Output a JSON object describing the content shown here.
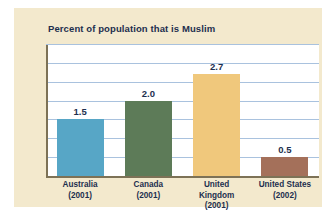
{
  "chart_data": {
    "type": "bar",
    "title": "Percent of population that is Muslim",
    "xlabel": "",
    "ylabel": "",
    "ylim": [
      0,
      3.5
    ],
    "grid": true,
    "legend": "none",
    "gridline_values": [
      0.5,
      1.0,
      1.5,
      2.0,
      2.5,
      3.0,
      3.5
    ],
    "categories": [
      "Australia",
      "Canada",
      "United Kingdom",
      "United States"
    ],
    "category_years": [
      "(2001)",
      "(2001)",
      "(2001)",
      "(2002)"
    ],
    "values": [
      1.5,
      2.0,
      2.7,
      0.5
    ],
    "value_labels": [
      "1.5",
      "2.0",
      "2.7",
      "0.5"
    ],
    "bar_colors": [
      "#57a6c6",
      "#5d7b58",
      "#f0c87c",
      "#a4705a"
    ]
  },
  "figure": {
    "panel_color": "#f3e9cd",
    "plot_background": "#ffffff",
    "gridline_color": "#a9c2de",
    "axis_color": "#7d7256",
    "text_color": "#1d2f4e"
  }
}
